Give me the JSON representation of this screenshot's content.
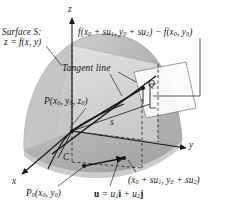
{
  "figure": {
    "type": "3d-surface-directional-derivative-diagram",
    "background_color": "#ffffff",
    "ink_color": "#161616",
    "surface_fill_light": "#cdcdcd",
    "surface_fill_mid": "#bdbdbd",
    "surface_fill_dark": "#a9a9a9",
    "plane_fill": "#dcdcdc",
    "base_fill": "#ababab"
  },
  "labels": {
    "surface_line1": "Surface S:",
    "surface_line2": "z = f(x, y)",
    "formula_f1": "f(x",
    "formula_sub0a": "0",
    "formula_mid1": " + su",
    "formula_sub1": "1",
    "formula_mid2": ", y",
    "formula_sub0b": "0",
    "formula_mid3": " + su",
    "formula_sub2": "2",
    "formula_mid4": ") − f(x",
    "formula_sub0c": "0",
    "formula_mid5": ", y",
    "formula_sub0d": "0",
    "formula_end": ")",
    "tangent_line": "Tangent line",
    "point_P_name": "P",
    "point_P_args": "(x",
    "point_P_sub0a": "0",
    "point_P_comma1": ", y",
    "point_P_sub0b": "0",
    "point_P_comma2": ", z",
    "point_P_sub0c": "0",
    "point_P_close": ")",
    "point_Q": "Q",
    "distance_s": "s",
    "curve_C": "C",
    "axis_x": "x",
    "axis_y": "y",
    "axis_z": "z",
    "point_P0_name": "P",
    "point_P0_sub": "0",
    "point_P0_args": "(x",
    "point_P0_sub0a": "0",
    "point_P0_comma": ", y",
    "point_P0_sub0b": "0",
    "point_P0_close": ")",
    "vector_u_name": "u",
    "vector_u_eq": " = u",
    "vector_u_sub1": "1",
    "vector_u_i": "i",
    "vector_u_plus": " + u",
    "vector_u_sub2": "2",
    "vector_u_j": "j",
    "point2_open": "(x",
    "point2_sub0a": "0",
    "point2_mid1": " + su",
    "point2_sub1": "1",
    "point2_mid2": ", y",
    "point2_sub0b": "0",
    "point2_mid3": " + su",
    "point2_sub2": "2",
    "point2_close": ")"
  }
}
